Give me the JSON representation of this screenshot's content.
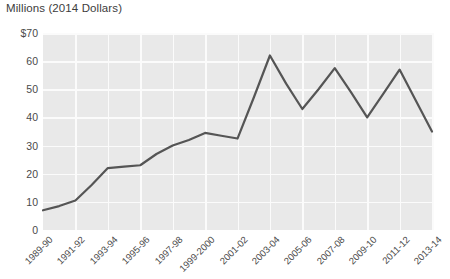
{
  "chart_data": {
    "type": "line",
    "title": "Millions (2014 Dollars)",
    "xlabel": "",
    "ylabel": "",
    "ylim": [
      0,
      70
    ],
    "yticks": [
      "$70",
      "60",
      "50",
      "40",
      "30",
      "20",
      "10",
      "0"
    ],
    "ytick_values": [
      70,
      60,
      50,
      40,
      30,
      20,
      10,
      0
    ],
    "grid": true,
    "legend": "none",
    "categories": [
      "1989-90",
      "1990-91",
      "1991-92",
      "1992-93",
      "1993-94",
      "1994-95",
      "1995-96",
      "1996-97",
      "1997-98",
      "1998-99",
      "1999-2000",
      "2000-01",
      "2001-02",
      "2002-03",
      "2003-04",
      "2004-05",
      "2005-06",
      "2006-07",
      "2007-08",
      "2008-09",
      "2009-10",
      "2010-11",
      "2011-12",
      "2012-13",
      "2013-14"
    ],
    "tick_labels": [
      "1989-90",
      "1991-92",
      "1993-94",
      "1995-96",
      "1997-98",
      "1999-2000",
      "2001-02",
      "2003-04",
      "2005-06",
      "2007-08",
      "2009-10",
      "2011-12",
      "2013-14"
    ],
    "series": [
      {
        "name": "Funding",
        "color": "#555555",
        "values": [
          7,
          8.5,
          10.5,
          16,
          22,
          22.5,
          23,
          27,
          30,
          32,
          34.5,
          33.5,
          32.5,
          47,
          62,
          52,
          43,
          50,
          57.5,
          49,
          40,
          48.5,
          57,
          46,
          35
        ]
      }
    ]
  },
  "style": {
    "panel_background": "#e9e9e9",
    "gridline_color": "#fbfbfb",
    "line_color": "#555555",
    "text_color": "#4a4a4a",
    "page_background": "#ffffff"
  }
}
